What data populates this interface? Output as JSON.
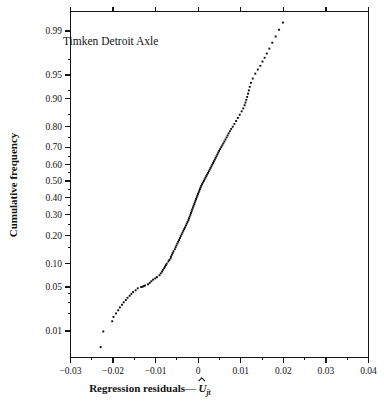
{
  "chart_data": {
    "type": "scatter",
    "title": "",
    "annotation": "Timken Detroit Axle",
    "xlabel": "Regression residuals—Û",
    "xlabel_main": "Regression residuals—",
    "xlabel_symbol": "U",
    "xlabel_subscript": "jt",
    "ylabel": "Cumulative frequency",
    "xlim": [
      -0.03,
      0.04
    ],
    "ylim_probability": [
      0.004,
      0.995
    ],
    "y_scale": "normal-probability",
    "grid": false,
    "legend": null,
    "xticks": [
      -0.03,
      -0.02,
      -0.01,
      0,
      0.01,
      0.02,
      0.03,
      0.04
    ],
    "xticklabels": [
      "−0.03",
      "−0.02",
      "−0.01",
      "0",
      "0.01",
      "0.02",
      "0.03",
      "0.04"
    ],
    "yticks": [
      0.01,
      0.05,
      0.1,
      0.2,
      0.3,
      0.4,
      0.5,
      0.6,
      0.7,
      0.8,
      0.9,
      0.95,
      0.99
    ],
    "yticklabels": [
      "0.01",
      "0.05",
      "0.10",
      "0.20",
      "0.30",
      "0.40",
      "0.50",
      "0.60",
      "0.70",
      "0.80",
      "0.90",
      "0.95",
      "0.99"
    ],
    "y_minor_ticks": [
      0.02,
      0.03,
      0.04,
      0.15,
      0.25,
      0.35,
      0.45,
      0.55,
      0.65,
      0.75,
      0.85,
      0.92,
      0.97
    ],
    "x_minor_ticks": [
      -0.025,
      -0.015,
      -0.005,
      0.005,
      0.015,
      0.025,
      0.035
    ],
    "points": [
      [
        -0.0229,
        0.005
      ],
      [
        -0.0223,
        0.0098
      ],
      [
        -0.0202,
        0.0148
      ],
      [
        -0.0199,
        0.0175
      ],
      [
        -0.0193,
        0.02
      ],
      [
        -0.0188,
        0.0225
      ],
      [
        -0.0184,
        0.025
      ],
      [
        -0.0179,
        0.0275
      ],
      [
        -0.0175,
        0.03
      ],
      [
        -0.017,
        0.0325
      ],
      [
        -0.0166,
        0.035
      ],
      [
        -0.0161,
        0.0375
      ],
      [
        -0.0157,
        0.04
      ],
      [
        -0.0153,
        0.0425
      ],
      [
        -0.0147,
        0.045
      ],
      [
        -0.0142,
        0.048
      ],
      [
        -0.0134,
        0.05
      ],
      [
        -0.0131,
        0.0505
      ],
      [
        -0.0128,
        0.0515
      ],
      [
        -0.0125,
        0.0525
      ],
      [
        -0.0118,
        0.0545
      ],
      [
        -0.0114,
        0.057
      ],
      [
        -0.011,
        0.06
      ],
      [
        -0.0106,
        0.063
      ],
      [
        -0.0101,
        0.0655
      ],
      [
        -0.0097,
        0.068
      ],
      [
        -0.0091,
        0.072
      ],
      [
        -0.0088,
        0.076
      ],
      [
        -0.0085,
        0.08
      ],
      [
        -0.0083,
        0.084
      ],
      [
        -0.008,
        0.088
      ],
      [
        -0.0078,
        0.092
      ],
      [
        -0.0076,
        0.096
      ],
      [
        -0.0074,
        0.1
      ],
      [
        -0.007,
        0.106
      ],
      [
        -0.0068,
        0.11
      ],
      [
        -0.0065,
        0.115
      ],
      [
        -0.0064,
        0.12
      ],
      [
        -0.0062,
        0.126
      ],
      [
        -0.006,
        0.132
      ],
      [
        -0.0058,
        0.138
      ],
      [
        -0.0055,
        0.145
      ],
      [
        -0.0053,
        0.152
      ],
      [
        -0.0051,
        0.159
      ],
      [
        -0.0049,
        0.166
      ],
      [
        -0.0047,
        0.173
      ],
      [
        -0.0045,
        0.18
      ],
      [
        -0.0043,
        0.188
      ],
      [
        -0.0041,
        0.196
      ],
      [
        -0.0039,
        0.204
      ],
      [
        -0.0037,
        0.212
      ],
      [
        -0.0035,
        0.22
      ],
      [
        -0.0033,
        0.228
      ],
      [
        -0.0031,
        0.236
      ],
      [
        -0.0029,
        0.245
      ],
      [
        -0.0027,
        0.254
      ],
      [
        -0.0025,
        0.263
      ],
      [
        -0.0023,
        0.272
      ],
      [
        -0.00215,
        0.281
      ],
      [
        -0.002,
        0.29
      ],
      [
        -0.00185,
        0.3
      ],
      [
        -0.0017,
        0.31
      ],
      [
        -0.00155,
        0.32
      ],
      [
        -0.0014,
        0.33
      ],
      [
        -0.00125,
        0.34
      ],
      [
        -0.0011,
        0.35
      ],
      [
        -0.00095,
        0.36
      ],
      [
        -0.0008,
        0.37
      ],
      [
        -0.00065,
        0.38
      ],
      [
        -0.0005,
        0.39
      ],
      [
        -0.00035,
        0.4
      ],
      [
        -0.0002,
        0.41
      ],
      [
        -5e-05,
        0.42
      ],
      [
        0.0001,
        0.43
      ],
      [
        0.00025,
        0.44
      ],
      [
        0.0004,
        0.45
      ],
      [
        0.00055,
        0.46
      ],
      [
        0.0007,
        0.47
      ],
      [
        0.0009,
        0.48
      ],
      [
        0.0011,
        0.49
      ],
      [
        0.0013,
        0.5
      ],
      [
        0.0015,
        0.51
      ],
      [
        0.0017,
        0.52
      ],
      [
        0.0019,
        0.53
      ],
      [
        0.0021,
        0.54
      ],
      [
        0.0023,
        0.55
      ],
      [
        0.0025,
        0.56
      ],
      [
        0.0027,
        0.57
      ],
      [
        0.0029,
        0.58
      ],
      [
        0.0031,
        0.59
      ],
      [
        0.0033,
        0.6
      ],
      [
        0.0035,
        0.61
      ],
      [
        0.0037,
        0.62
      ],
      [
        0.0039,
        0.63
      ],
      [
        0.0041,
        0.64
      ],
      [
        0.0043,
        0.65
      ],
      [
        0.0045,
        0.66
      ],
      [
        0.0047,
        0.67
      ],
      [
        0.0049,
        0.68
      ],
      [
        0.00515,
        0.69
      ],
      [
        0.0054,
        0.7
      ],
      [
        0.00565,
        0.71
      ],
      [
        0.0059,
        0.72
      ],
      [
        0.00615,
        0.73
      ],
      [
        0.0064,
        0.74
      ],
      [
        0.00665,
        0.75
      ],
      [
        0.0069,
        0.76
      ],
      [
        0.00715,
        0.77
      ],
      [
        0.00745,
        0.78
      ],
      [
        0.00775,
        0.79
      ],
      [
        0.0081,
        0.8
      ],
      [
        0.0085,
        0.812
      ],
      [
        0.0089,
        0.824
      ],
      [
        0.0093,
        0.836
      ],
      [
        0.00975,
        0.848
      ],
      [
        0.0102,
        0.86
      ],
      [
        0.0106,
        0.87
      ],
      [
        0.0109,
        0.88
      ],
      [
        0.0111,
        0.888
      ],
      [
        0.0113,
        0.896
      ],
      [
        0.0115,
        0.904
      ],
      [
        0.0117,
        0.912
      ],
      [
        0.0119,
        0.92
      ],
      [
        0.0121,
        0.928
      ],
      [
        0.0124,
        0.936
      ],
      [
        0.0128,
        0.944
      ],
      [
        0.0134,
        0.952
      ],
      [
        0.014,
        0.958
      ],
      [
        0.0146,
        0.963
      ],
      [
        0.0151,
        0.968
      ],
      [
        0.0156,
        0.972
      ],
      [
        0.0161,
        0.976
      ],
      [
        0.0167,
        0.98
      ],
      [
        0.0174,
        0.984
      ],
      [
        0.0182,
        0.9875
      ],
      [
        0.019,
        0.9905
      ],
      [
        0.0199,
        0.993
      ]
    ]
  },
  "colors": {
    "ink": "#131313",
    "point": "#0d0d0d",
    "background": "#ffffff"
  }
}
